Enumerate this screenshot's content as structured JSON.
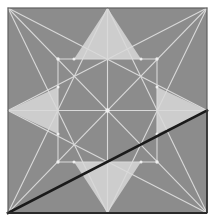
{
  "figure": {
    "canvas": {
      "width": 214,
      "height": 223
    },
    "panel": {
      "x": 8,
      "y": 8,
      "width": 199,
      "height": 205
    },
    "colors": {
      "page_background": "#ffffff",
      "panel_fill": "#8c8c8c",
      "construction_line": "#d9d9d9",
      "highlight_fill": "#cdcdcd",
      "dark_chord": "#1a1a1a",
      "panel_border": "#5f5f5f"
    },
    "line_widths": {
      "construction_line": 1.1,
      "dark_chord": 2.6,
      "panel_border": 1.2
    },
    "points": {
      "top_left": [
        8,
        8
      ],
      "top_mid": [
        107.5,
        8
      ],
      "top_right": [
        207,
        8
      ],
      "left_mid": [
        8,
        110.5
      ],
      "center": [
        107.5,
        110.5
      ],
      "right_mid": [
        207,
        110.5
      ],
      "bottom_left": [
        8,
        213
      ],
      "bottom_mid": [
        107.5,
        213
      ],
      "bottom_right": [
        207,
        213
      ],
      "inner_top_left": [
        58,
        59
      ],
      "inner_top_right": [
        157,
        59
      ],
      "inner_bottom_left": [
        58,
        162
      ],
      "inner_bottom_right": [
        157,
        162
      ],
      "star_top_base_left": [
        74,
        59
      ],
      "star_top_base_right": [
        141,
        59
      ],
      "star_left_base_top": [
        58,
        87
      ],
      "star_left_base_bottom": [
        58,
        134
      ],
      "star_right_base_top": [
        157,
        87
      ],
      "star_right_base_bottom": [
        157,
        134
      ],
      "star_bottom_base_left": [
        74,
        162
      ],
      "star_bottom_base_right": [
        141,
        162
      ]
    },
    "highlight_triangles": [
      {
        "name": "star-point-north",
        "path": "107.5,8 74,59 141,59"
      },
      {
        "name": "star-point-west",
        "path": "8,110.5 58,87 58,134"
      },
      {
        "name": "star-point-east",
        "path": "207,110.5 157,87 157,134"
      },
      {
        "name": "star-point-south",
        "path": "107.5,213 74,162 141,162"
      }
    ],
    "construction_lines": [
      {
        "name": "diagonal-tl-br",
        "from": [
          8,
          8
        ],
        "to": [
          207,
          213
        ]
      },
      {
        "name": "diagonal-tr-bl",
        "from": [
          207,
          8
        ],
        "to": [
          8,
          213
        ]
      },
      {
        "name": "median-vertical",
        "from": [
          107.5,
          8
        ],
        "to": [
          107.5,
          213
        ]
      },
      {
        "name": "median-horizontal",
        "from": [
          8,
          110.5
        ],
        "to": [
          207,
          110.5
        ]
      },
      {
        "name": "tl-to-right-mid",
        "from": [
          8,
          8
        ],
        "to": [
          207,
          110.5
        ]
      },
      {
        "name": "tl-to-bottom-mid",
        "from": [
          8,
          8
        ],
        "to": [
          107.5,
          213
        ]
      },
      {
        "name": "tr-to-left-mid",
        "from": [
          207,
          8
        ],
        "to": [
          8,
          110.5
        ]
      },
      {
        "name": "tr-to-bottom-mid",
        "from": [
          207,
          8
        ],
        "to": [
          107.5,
          213
        ]
      },
      {
        "name": "bl-to-right-mid",
        "from": [
          8,
          213
        ],
        "to": [
          207,
          110.5
        ]
      },
      {
        "name": "bl-to-top-mid",
        "from": [
          8,
          213
        ],
        "to": [
          107.5,
          8
        ]
      },
      {
        "name": "br-to-left-mid",
        "from": [
          207,
          213
        ],
        "to": [
          8,
          110.5
        ]
      },
      {
        "name": "br-to-top-mid",
        "from": [
          207,
          213
        ],
        "to": [
          107.5,
          8
        ]
      },
      {
        "name": "inner-square-top",
        "from": [
          58,
          59
        ],
        "to": [
          157,
          59
        ]
      },
      {
        "name": "inner-square-bottom",
        "from": [
          58,
          162
        ],
        "to": [
          157,
          162
        ]
      },
      {
        "name": "inner-square-left",
        "from": [
          58,
          59
        ],
        "to": [
          58,
          162
        ]
      },
      {
        "name": "inner-square-right",
        "from": [
          157,
          59
        ],
        "to": [
          157,
          162
        ]
      }
    ],
    "dark_chord": {
      "name": "dark-diagonal-chord",
      "from": [
        8,
        213
      ],
      "to": [
        207,
        110.5
      ],
      "label": "bottom-left-to-right-midpoint"
    }
  }
}
